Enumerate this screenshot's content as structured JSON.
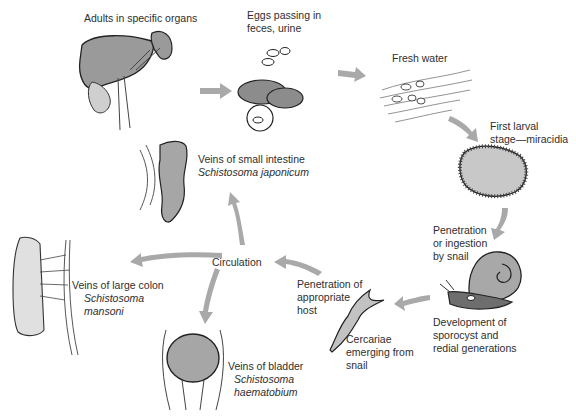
{
  "diagram": {
    "stages": [
      {
        "id": "adults",
        "lines": [
          "Adults in specific organs"
        ]
      },
      {
        "id": "eggs",
        "lines": [
          "Eggs passing in",
          "feces, urine"
        ]
      },
      {
        "id": "fresh-water",
        "lines": [
          "Fresh water"
        ]
      },
      {
        "id": "miracidia",
        "lines": [
          "First larval",
          "stage—miracidia"
        ]
      },
      {
        "id": "snail-penetration",
        "lines": [
          "Penetration",
          "or ingestion",
          "by snail"
        ]
      },
      {
        "id": "sporocyst",
        "lines": [
          "Development of",
          "sporocyst and",
          "redial generations"
        ]
      },
      {
        "id": "cercariae",
        "lines": [
          "Cercariae",
          "emerging from",
          "snail"
        ]
      },
      {
        "id": "host-penetration",
        "lines": [
          "Penetration of",
          "appropriate",
          "host"
        ]
      },
      {
        "id": "circulation",
        "lines": [
          "Circulation"
        ]
      }
    ],
    "destinations": [
      {
        "id": "small-intestine",
        "site": "Veins of small intestine",
        "species": "Schistosoma japonicum"
      },
      {
        "id": "large-colon",
        "site": "Veins of large colon",
        "species_lines": [
          "Schistosoma",
          "mansoni"
        ]
      },
      {
        "id": "bladder",
        "site": "Veins of bladder",
        "species_lines": [
          "Schistosoma",
          "haematobium"
        ]
      }
    ],
    "colors": {
      "arrow": "#a9a9a9",
      "organ_fill": "#a6a6a6",
      "outline": "#2a2a2a",
      "background": "#ffffff"
    }
  }
}
